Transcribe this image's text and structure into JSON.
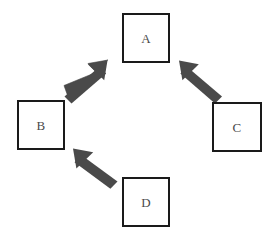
{
  "diagram": {
    "type": "cycle-diagram",
    "canvas": {
      "width": 278,
      "height": 243,
      "background": "#ffffff"
    },
    "style": {
      "box_border_color": "#1a1a1a",
      "box_fill_color": "#ffffff",
      "box_border_width": 2.5,
      "label_color": "#4a4a4a",
      "arrow_color": "#4a4a4a"
    },
    "nodes": [
      {
        "id": "A",
        "label": "A",
        "x": 122,
        "y": 13,
        "width": 48,
        "height": 50,
        "position": "top-center"
      },
      {
        "id": "B",
        "label": "B",
        "x": 17,
        "y": 100,
        "width": 48,
        "height": 50,
        "position": "left-middle"
      },
      {
        "id": "C",
        "label": "C",
        "x": 212,
        "y": 102,
        "width": 50,
        "height": 50,
        "position": "right-middle"
      },
      {
        "id": "D",
        "label": "D",
        "x": 122,
        "y": 177,
        "width": 48,
        "height": 50,
        "position": "bottom-center"
      }
    ],
    "arrows": [
      {
        "id": "arrow-d-to-b",
        "from": "D",
        "to": "B",
        "direction": "up-left",
        "tail_x": 117,
        "tail_y": 184,
        "tip_x": 73,
        "tip_y": 148
      },
      {
        "id": "arrow-b-to-a",
        "from": "B",
        "to": "A",
        "direction": "up-right",
        "tail_x": 66,
        "tail_y": 97,
        "tip_x": 108,
        "tip_y": 60
      },
      {
        "id": "arrow-c-to-a",
        "from": "C",
        "to": "A",
        "direction": "up-left",
        "tail_x": 220,
        "tail_y": 99,
        "tip_x": 179,
        "tip_y": 60
      }
    ]
  }
}
